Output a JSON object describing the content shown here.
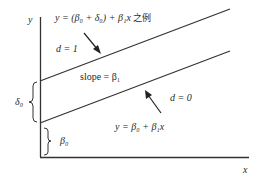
{
  "diagram": {
    "axes": {
      "y_label": "y",
      "x_label": "x"
    },
    "lines": {
      "upper": {
        "equation_prefix": "y = (β",
        "equation": "y = (β₀ + δ₀) + β₁x",
        "equation_suffix_cjk": "之例",
        "group_label": "d = 1"
      },
      "lower": {
        "equation": "y = β₀ + β₁x",
        "group_label": "d = 0"
      }
    },
    "slope_label": "slope = β₁",
    "intercept_shift_label": "δ₀",
    "intercept_label": "β₀",
    "colors": {
      "line": "#333333",
      "text": "#2a2a2a",
      "background": "#ffffff"
    }
  }
}
